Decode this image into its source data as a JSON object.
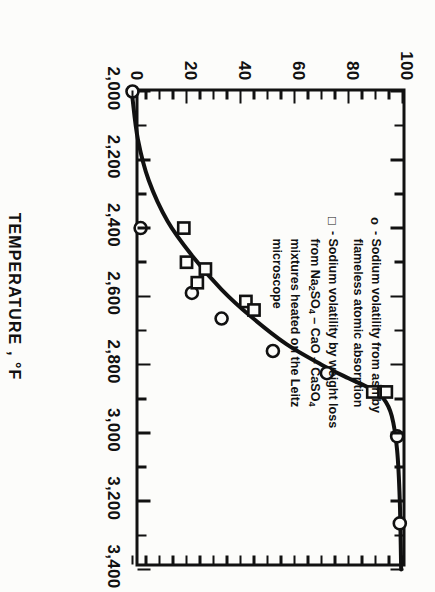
{
  "figure": {
    "orientation": "rotated-90-clockwise-on-page"
  },
  "axis": {
    "x_title": "TEMPERATURE , °F",
    "y_title": "VOLATILIZED, percent",
    "x_ticklabels": [
      "2,000",
      "2,200",
      "2,400",
      "2,600",
      "2,800",
      "3,000",
      "3,200",
      "3,400"
    ],
    "y_ticklabels": [
      "0",
      "20",
      "40",
      "60",
      "80",
      "100"
    ]
  },
  "legend": {
    "entries": [
      {
        "symbol": "o",
        "dash": "-",
        "lines": [
          "Sodium volatility from ash by",
          "flameless atomic absorption"
        ]
      },
      {
        "symbol": "□",
        "dash": "-",
        "lines": [
          "Sodium volatility by weight loss",
          "from Na2SO4 – CaO – CaSO4",
          "mixtures heated on the Leitz",
          "microscope"
        ]
      }
    ]
  },
  "chart_data": {
    "type": "scatter",
    "title": "",
    "xlabel": "TEMPERATURE , °F",
    "ylabel": "VOLATILIZED, percent",
    "xlim": [
      2000,
      3400
    ],
    "ylim": [
      0,
      100
    ],
    "xtick_step": 200,
    "xminor_step": 100,
    "ytick_step": 20,
    "grid": false,
    "legend_position": "inside-upper-right",
    "series": [
      {
        "name": "Sodium volatility from ash by flameless atomic absorption",
        "marker": "circle",
        "points": [
          {
            "x": 2000,
            "y": 0
          },
          {
            "x": 2400,
            "y": 3
          },
          {
            "x": 2590,
            "y": 22
          },
          {
            "x": 2665,
            "y": 33
          },
          {
            "x": 2760,
            "y": 52
          },
          {
            "x": 2825,
            "y": 72
          },
          {
            "x": 2880,
            "y": 92
          },
          {
            "x": 3010,
            "y": 98
          },
          {
            "x": 3265,
            "y": 99
          }
        ]
      },
      {
        "name": "Sodium volatility by weight loss from Na2SO4 - CaO - CaSO4 mixtures heated on the Leitz microscope",
        "marker": "square",
        "points": [
          {
            "x": 2400,
            "y": 19
          },
          {
            "x": 2500,
            "y": 20
          },
          {
            "x": 2520,
            "y": 27
          },
          {
            "x": 2560,
            "y": 24
          },
          {
            "x": 2615,
            "y": 42
          },
          {
            "x": 2640,
            "y": 45
          },
          {
            "x": 2880,
            "y": 94
          },
          {
            "x": 2880,
            "y": 89
          }
        ]
      }
    ],
    "fitted_curve": {
      "name": "fitted S-curve",
      "points": [
        {
          "x": 2020,
          "y": 0
        },
        {
          "x": 2140,
          "y": 2
        },
        {
          "x": 2260,
          "y": 6
        },
        {
          "x": 2380,
          "y": 13
        },
        {
          "x": 2480,
          "y": 22
        },
        {
          "x": 2580,
          "y": 33
        },
        {
          "x": 2660,
          "y": 44
        },
        {
          "x": 2740,
          "y": 57
        },
        {
          "x": 2800,
          "y": 70
        },
        {
          "x": 2840,
          "y": 80
        },
        {
          "x": 2870,
          "y": 88
        },
        {
          "x": 2900,
          "y": 93
        },
        {
          "x": 2950,
          "y": 96
        },
        {
          "x": 3050,
          "y": 98
        },
        {
          "x": 3200,
          "y": 99
        },
        {
          "x": 3400,
          "y": 99.5
        }
      ]
    }
  }
}
